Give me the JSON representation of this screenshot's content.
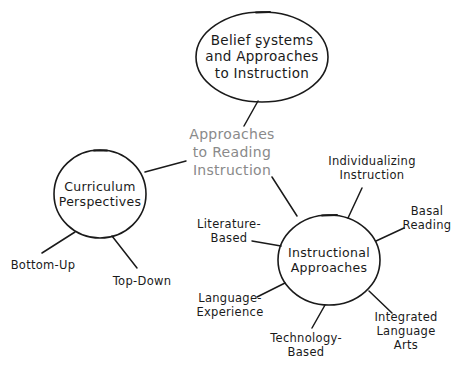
{
  "diagram": {
    "title": "Approaches to Reading Instruction",
    "style": "hand-drawn concept map",
    "background_color": "#ffffff",
    "stroke_color": "#1a1a1a",
    "center_text_color": "#8a8a8a",
    "center": {
      "label": "Approaches\nto Reading\nInstruction",
      "shape": "none",
      "x": 232,
      "y": 152
    },
    "nodes": [
      {
        "id": "belief-systems",
        "label": "Belief ʂystems\nand Approaches\nto Instruction",
        "shape": "ellipse",
        "x": 262,
        "y": 57,
        "rx": 66,
        "ry": 45
      },
      {
        "id": "curriculum-perspectives",
        "label": "Curriculum\nPerspectives",
        "shape": "circle",
        "x": 100,
        "y": 194,
        "rx": 46,
        "ry": 44
      },
      {
        "id": "instructional-approaches",
        "label": "Instructional\nApproaches",
        "shape": "circle",
        "x": 329,
        "y": 260,
        "rx": 51,
        "ry": 45
      }
    ],
    "leaves": [
      {
        "id": "bottom-up",
        "label": "Bottom-Up",
        "parent": "curriculum-perspectives",
        "x": 43,
        "y": 265
      },
      {
        "id": "top-down",
        "label": "Top-Down",
        "parent": "curriculum-perspectives",
        "x": 142,
        "y": 281
      },
      {
        "id": "individualizing-instruction",
        "label": "Individualizing\nInstruction",
        "parent": "instructional-approaches",
        "x": 372,
        "y": 168
      },
      {
        "id": "basal-reading",
        "label": "Basal\nReading",
        "parent": "instructional-approaches",
        "x": 427,
        "y": 218
      },
      {
        "id": "integrated-language-arts",
        "label": "Integrated\nLanguage Arts",
        "parent": "instructional-approaches",
        "x": 406,
        "y": 331
      },
      {
        "id": "technology-based",
        "label": "Technology-\nBased",
        "parent": "instructional-approaches",
        "x": 306,
        "y": 345
      },
      {
        "id": "language-experience",
        "label": "Language-\nExperience",
        "parent": "instructional-approaches",
        "x": 230,
        "y": 305
      },
      {
        "id": "literature-based",
        "label": "Literature-\nBased",
        "parent": "instructional-approaches",
        "x": 229,
        "y": 231
      }
    ]
  }
}
